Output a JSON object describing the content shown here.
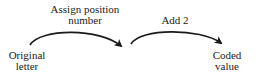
{
  "diagram": {
    "nodes": [
      {
        "id": "original",
        "line1": "Original",
        "line2": "letter"
      },
      {
        "id": "coded",
        "line1": "Coded",
        "line2": "value"
      }
    ],
    "edges": [
      {
        "id": "step1",
        "line1": "Assign position",
        "line2": "number"
      },
      {
        "id": "step2",
        "line1": "Add 2"
      }
    ],
    "colors": {
      "stroke": "#1a1a1a",
      "text": "#222222"
    }
  }
}
